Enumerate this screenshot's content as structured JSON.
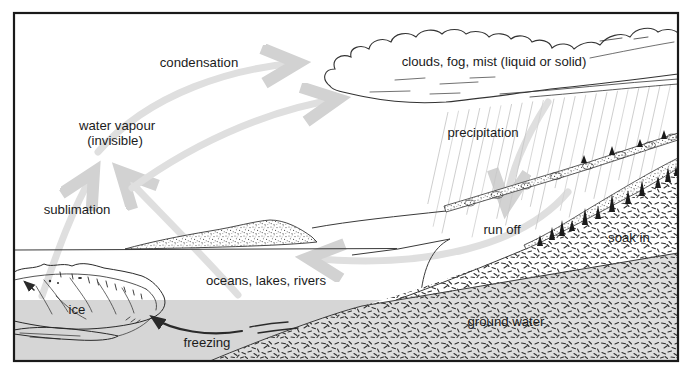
{
  "diagram": {
    "type": "water-cycle",
    "labels": {
      "condensation": "condensation",
      "clouds": "clouds, fog, mist (liquid or solid)",
      "water_vapour_line1": "water vapour",
      "water_vapour_line2": "(invisible)",
      "precipitation": "precipitation",
      "sublimation": "sublimation",
      "run_off": "run off",
      "soak_in": "soak in",
      "oceans": "oceans, lakes, rivers",
      "ice": "ice",
      "ground_water": "ground water",
      "freezing": "freezing"
    },
    "colors": {
      "line": "#2e2e2e",
      "water_fill": "#d6d6d6",
      "ground_fill": "#dedede",
      "cycle_arrow": "#dfdfdf",
      "rain": "#c8c8c8",
      "background": "#ffffff"
    }
  }
}
